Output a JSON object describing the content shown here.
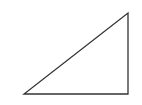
{
  "diagram": {
    "shape": "right-triangle",
    "stroke_color": "#333333",
    "fill_color": "none",
    "stroke_width": 1.3,
    "points": [
      [
        24,
        94
      ],
      [
        128,
        94
      ],
      [
        128,
        13
      ]
    ]
  }
}
